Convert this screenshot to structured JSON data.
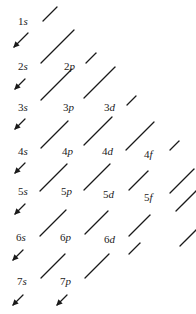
{
  "diagram": {
    "line_color": "#1a1a1a",
    "text_color": "#222222",
    "orbitals": [
      {
        "n": "1",
        "l": "s",
        "x": 28,
        "y": 22
      },
      {
        "n": "2",
        "l": "s",
        "x": 28,
        "y": 67
      },
      {
        "n": "2",
        "l": "p",
        "x": 74,
        "y": 67
      },
      {
        "n": "3",
        "l": "s",
        "x": 28,
        "y": 108
      },
      {
        "n": "3",
        "l": "p",
        "x": 73,
        "y": 108
      },
      {
        "n": "3",
        "l": "d",
        "x": 114,
        "y": 108
      },
      {
        "n": "4",
        "l": "s",
        "x": 28,
        "y": 152
      },
      {
        "n": "4",
        "l": "p",
        "x": 72,
        "y": 152
      },
      {
        "n": "4",
        "l": "d",
        "x": 112,
        "y": 152
      },
      {
        "n": "4",
        "l": "f",
        "x": 154,
        "y": 155
      },
      {
        "n": "5",
        "l": "s",
        "x": 28,
        "y": 192
      },
      {
        "n": "5",
        "l": "p",
        "x": 71,
        "y": 192
      },
      {
        "n": "5",
        "l": "d",
        "x": 113,
        "y": 195
      },
      {
        "n": "5",
        "l": "f",
        "x": 154,
        "y": 198
      },
      {
        "n": "6",
        "l": "s",
        "x": 26,
        "y": 238
      },
      {
        "n": "6",
        "l": "p",
        "x": 70,
        "y": 238
      },
      {
        "n": "6",
        "l": "d",
        "x": 114,
        "y": 240
      },
      {
        "n": "7",
        "l": "s",
        "x": 27,
        "y": 282
      },
      {
        "n": "7",
        "l": "p",
        "x": 70,
        "y": 282
      }
    ],
    "segments": [
      {
        "x1": 43,
        "y1": 21,
        "x2": 57,
        "y2": 7
      },
      {
        "x1": 41,
        "y1": 63,
        "x2": 74,
        "y2": 30
      },
      {
        "x1": 86,
        "y1": 63,
        "x2": 96,
        "y2": 53
      },
      {
        "x1": 41,
        "y1": 100,
        "x2": 72,
        "y2": 69
      },
      {
        "x1": 84,
        "y1": 98,
        "x2": 115,
        "y2": 67
      },
      {
        "x1": 127,
        "y1": 105,
        "x2": 136,
        "y2": 96
      },
      {
        "x1": 41,
        "y1": 148,
        "x2": 68,
        "y2": 121
      },
      {
        "x1": 84,
        "y1": 145,
        "x2": 112,
        "y2": 117
      },
      {
        "x1": 126,
        "y1": 150,
        "x2": 154,
        "y2": 122
      },
      {
        "x1": 170,
        "y1": 150,
        "x2": 179,
        "y2": 141
      },
      {
        "x1": 40,
        "y1": 191,
        "x2": 67,
        "y2": 164
      },
      {
        "x1": 84,
        "y1": 190,
        "x2": 110,
        "y2": 164
      },
      {
        "x1": 129,
        "y1": 190,
        "x2": 148,
        "y2": 171
      },
      {
        "x1": 170,
        "y1": 193,
        "x2": 194,
        "y2": 169
      },
      {
        "x1": 40,
        "y1": 236,
        "x2": 66,
        "y2": 210
      },
      {
        "x1": 85,
        "y1": 234,
        "x2": 108,
        "y2": 211
      },
      {
        "x1": 129,
        "y1": 236,
        "x2": 150,
        "y2": 215
      },
      {
        "x1": 176,
        "y1": 211,
        "x2": 196,
        "y2": 191
      },
      {
        "x1": 41,
        "y1": 278,
        "x2": 65,
        "y2": 254
      },
      {
        "x1": 85,
        "y1": 278,
        "x2": 109,
        "y2": 254
      },
      {
        "x1": 129,
        "y1": 254,
        "x2": 140,
        "y2": 243
      },
      {
        "x1": 180,
        "y1": 246,
        "x2": 196,
        "y2": 230
      }
    ],
    "arrows": [
      {
        "x1": 28,
        "y1": 33,
        "x2": 14,
        "y2": 47
      },
      {
        "x1": 25,
        "y1": 79,
        "x2": 15,
        "y2": 89
      },
      {
        "x1": 25,
        "y1": 119,
        "x2": 15,
        "y2": 129
      },
      {
        "x1": 25,
        "y1": 163,
        "x2": 15,
        "y2": 173
      },
      {
        "x1": 25,
        "y1": 204,
        "x2": 15,
        "y2": 214
      },
      {
        "x1": 23,
        "y1": 250,
        "x2": 13,
        "y2": 260
      },
      {
        "x1": 23,
        "y1": 295,
        "x2": 13,
        "y2": 305
      },
      {
        "x1": 67,
        "y1": 295,
        "x2": 57,
        "y2": 305
      }
    ]
  }
}
